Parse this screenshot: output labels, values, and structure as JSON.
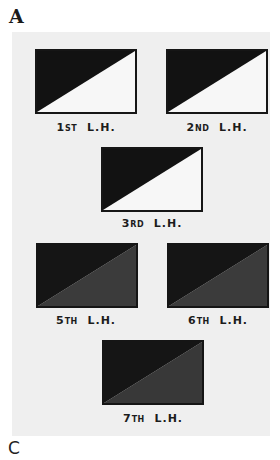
{
  "figure": {
    "panel_label_top": "A",
    "panel_label_bottom": "C",
    "panel_background": "#efefef"
  },
  "flags": [
    {
      "id": "1st",
      "number": "1",
      "suffix": "ST",
      "unit": "L.H.",
      "upper_color": "#121212",
      "lower_color": "#f7f7f7"
    },
    {
      "id": "2nd",
      "number": "2",
      "suffix": "ND",
      "unit": "L.H.",
      "upper_color": "#121212",
      "lower_color": "#f7f7f7"
    },
    {
      "id": "3rd",
      "number": "3",
      "suffix": "RD",
      "unit": "L.H.",
      "upper_color": "#121212",
      "lower_color": "#f7f7f7"
    },
    {
      "id": "5th",
      "number": "5",
      "suffix": "TH",
      "unit": "L.H.",
      "upper_color": "#151515",
      "lower_color": "#3b3b3b"
    },
    {
      "id": "6th",
      "number": "6",
      "suffix": "TH",
      "unit": "L.H.",
      "upper_color": "#151515",
      "lower_color": "#3b3b3b"
    },
    {
      "id": "7th",
      "number": "7",
      "suffix": "TH",
      "unit": "L.H.",
      "upper_color": "#151515",
      "lower_color": "#383838"
    }
  ]
}
